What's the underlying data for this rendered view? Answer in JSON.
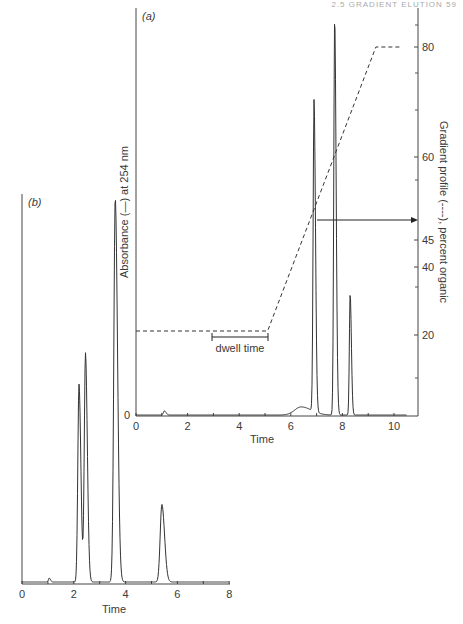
{
  "page_header": "2.5 GRADIENT ELUTION 59",
  "chart_data": [
    {
      "id": "a",
      "panel_label": "(a)",
      "type": "line",
      "title": "",
      "xlabel": "Time",
      "ylabel": "Absorbance (—) at 254 nm",
      "y2label": "Gradient profile (----), percent organic",
      "xlim": [
        0,
        10.5
      ],
      "xticks": [
        0,
        2,
        4,
        6,
        8,
        10
      ],
      "xtick_labels": [
        "0",
        "2",
        "4",
        "6",
        "8",
        "10"
      ],
      "yticks_left": [
        "0"
      ],
      "y2ticks": [
        20,
        40,
        45,
        60,
        80
      ],
      "y2tick_labels": [
        "20",
        "40",
        "45",
        "60",
        "80"
      ],
      "grid": false,
      "series": [
        {
          "name": "Absorbance at 254 nm",
          "style": "solid",
          "peaks": [
            {
              "time": 1.1,
              "relative_height": 0.01
            },
            {
              "time": 6.4,
              "relative_height": 0.02
            },
            {
              "time": 6.9,
              "relative_height": 0.77
            },
            {
              "time": 7.7,
              "relative_height": 0.98
            },
            {
              "time": 8.3,
              "relative_height": 0.3
            }
          ]
        },
        {
          "name": "Gradient profile (percent organic)",
          "style": "dashed",
          "x": [
            0,
            5.1,
            9.3,
            10.3
          ],
          "y": [
            20,
            20,
            80,
            80
          ]
        }
      ],
      "annotations": [
        {
          "text": "dwell time",
          "x_start": 3.0,
          "x_end": 5.1
        },
        {
          "text": "arrow to 45",
          "from_time": 6.9,
          "to_axis_value": 45
        }
      ]
    },
    {
      "id": "b",
      "panel_label": "(b)",
      "type": "line",
      "title": "",
      "xlabel": "Time",
      "ylabel": "",
      "xlim": [
        0,
        8
      ],
      "xticks": [
        0,
        2,
        4,
        6,
        8
      ],
      "xtick_labels": [
        "0",
        "2",
        "4",
        "6",
        "8"
      ],
      "grid": false,
      "series": [
        {
          "name": "Absorbance",
          "style": "solid",
          "peaks": [
            {
              "time": 1.05,
              "relative_height": 0.01
            },
            {
              "time": 2.2,
              "relative_height": 0.51
            },
            {
              "time": 2.45,
              "relative_height": 0.59
            },
            {
              "time": 3.6,
              "relative_height": 0.99
            },
            {
              "time": 5.4,
              "relative_height": 0.2
            }
          ]
        }
      ]
    }
  ],
  "labels": {
    "a_panel": "(a)",
    "b_panel": "(b)",
    "a_ylabel": "Absorbance (—) at 254 nm",
    "a_y2label": "Gradient profile (----), percent organic",
    "a_xlabel": "Time",
    "b_xlabel": "Time",
    "dwell": "dwell time",
    "a_zero": "0"
  }
}
